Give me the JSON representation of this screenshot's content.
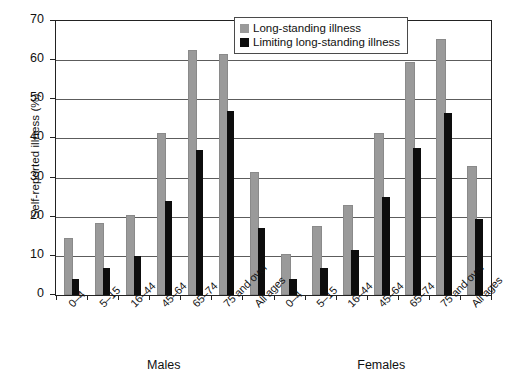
{
  "chart_data": {
    "type": "bar",
    "title": "",
    "xlabel": "",
    "ylabel": "Self-reported illness (%)",
    "ylim": [
      0,
      70
    ],
    "ytick_step": 10,
    "yticks": [
      0,
      10,
      20,
      30,
      40,
      50,
      60,
      70
    ],
    "grid": true,
    "legend_position": "top-center",
    "grouped": true,
    "group_labels": [
      "Males",
      "Females"
    ],
    "categories": [
      "0–4",
      "5–15",
      "16–44",
      "45–64",
      "65–74",
      "75 and over",
      "All ages"
    ],
    "series": [
      {
        "name": "Long-standing illness",
        "color": "#9a9a9a",
        "values_by_group": {
          "Males": [
            14,
            18,
            20,
            41,
            62,
            61,
            31
          ],
          "Females": [
            10,
            17,
            22.5,
            41,
            59,
            65,
            32.5
          ]
        }
      },
      {
        "name": "Limiting long-standing illness",
        "color": "#0d0d0d",
        "values_by_group": {
          "Males": [
            4,
            7,
            10,
            24,
            37,
            47,
            17
          ],
          "Females": [
            4,
            7,
            11.5,
            25,
            37.5,
            46.5,
            19.5
          ]
        }
      }
    ]
  },
  "legend": {
    "items": [
      {
        "label": "Long-standing illness",
        "swatch": "light"
      },
      {
        "label": "Limiting long-standing illness",
        "swatch": "dark"
      }
    ]
  },
  "axis": {
    "y_title": "Self-reported illness (%)",
    "y_tick_labels": [
      "70",
      "60",
      "50",
      "40",
      "30",
      "20",
      "10",
      "0"
    ]
  },
  "groups": [
    {
      "label": "Males"
    },
    {
      "label": "Females"
    }
  ]
}
